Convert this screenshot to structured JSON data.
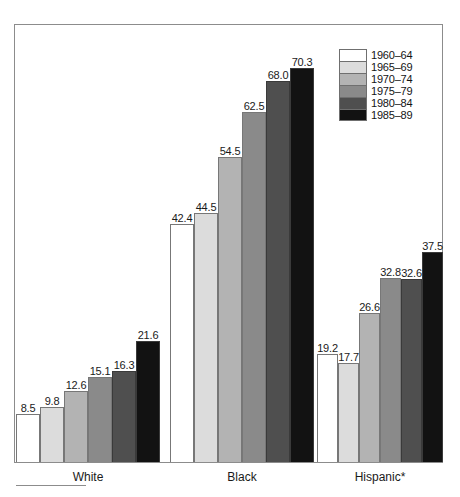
{
  "chart_data": {
    "type": "bar",
    "title": "",
    "subtitle": "",
    "xlabel": "",
    "ylabel": "",
    "ylim": [
      0,
      78
    ],
    "grid": false,
    "legend_position": "top-right",
    "categories": [
      "White",
      "Black",
      "Hispanic*"
    ],
    "series": [
      {
        "name": "1960–64",
        "color": "#ffffff",
        "values": [
          8.5,
          42.4,
          19.2
        ]
      },
      {
        "name": "1965–69",
        "color": "#dcdcdc",
        "values": [
          9.8,
          44.5,
          17.7
        ]
      },
      {
        "name": "1970–74",
        "color": "#b3b3b3",
        "values": [
          12.6,
          54.5,
          26.6
        ]
      },
      {
        "name": "1975–79",
        "color": "#8a8a8a",
        "values": [
          15.1,
          62.5,
          32.8
        ]
      },
      {
        "name": "1980–84",
        "color": "#4f4f4f",
        "values": [
          16.3,
          68.0,
          32.6
        ]
      },
      {
        "name": "1985–89",
        "color": "#121212",
        "values": [
          21.6,
          70.3,
          37.5
        ]
      }
    ],
    "value_labels": {
      "White": [
        "8.5",
        "9.8",
        "12.6",
        "15.1",
        "16.3",
        "21.6"
      ],
      "Black": [
        "42.4",
        "44.5",
        "54.5",
        "62.5",
        "68.0",
        "70.3"
      ],
      "Hispanic*": [
        "19.2",
        "17.7",
        "26.6",
        "32.8",
        "32.6",
        "37.5"
      ]
    }
  },
  "legend": {
    "items": [
      {
        "label": "1960–64",
        "color": "#ffffff"
      },
      {
        "label": "1965–69",
        "color": "#dcdcdc"
      },
      {
        "label": "1970–74",
        "color": "#b3b3b3"
      },
      {
        "label": "1975–79",
        "color": "#8a8a8a"
      },
      {
        "label": "1980–84",
        "color": "#4f4f4f"
      },
      {
        "label": "1985–89",
        "color": "#121212"
      }
    ]
  },
  "axis": {
    "categories": [
      {
        "label": "White"
      },
      {
        "label": "Black"
      },
      {
        "label": "Hispanic*"
      }
    ]
  }
}
